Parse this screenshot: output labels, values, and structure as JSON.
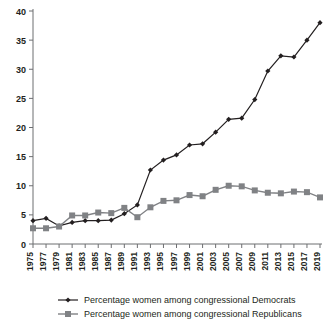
{
  "chart_data": {
    "type": "line",
    "title": "",
    "xlabel": "",
    "ylabel": "",
    "ylim": [
      0,
      40
    ],
    "yticks": [
      0,
      5,
      10,
      15,
      20,
      25,
      30,
      35,
      40
    ],
    "grid": false,
    "legend_position": "bottom",
    "x": [
      1975,
      1977,
      1979,
      1981,
      1983,
      1985,
      1987,
      1989,
      1991,
      1993,
      1995,
      1997,
      1999,
      2001,
      2003,
      2005,
      2007,
      2009,
      2011,
      2013,
      2015,
      2017,
      2019
    ],
    "series": [
      {
        "name": "Percentage women among congressional Democrats",
        "color": "#231f20",
        "marker": "diamond",
        "values": [
          4.0,
          4.4,
          3.1,
          3.7,
          4.0,
          4.0,
          4.1,
          5.2,
          6.7,
          12.7,
          14.4,
          15.3,
          17.0,
          17.2,
          19.2,
          21.4,
          21.6,
          24.8,
          29.7,
          32.3,
          32.1,
          35.0,
          38.0
        ]
      },
      {
        "name": "Percentage women among congressional Republicans",
        "color": "#808285",
        "marker": "square",
        "values": [
          2.7,
          2.7,
          3.0,
          4.9,
          4.9,
          5.4,
          5.3,
          6.2,
          4.6,
          6.3,
          7.4,
          7.5,
          8.4,
          8.2,
          9.3,
          10.0,
          9.9,
          9.2,
          8.8,
          8.7,
          9.0,
          8.9,
          8.0
        ]
      }
    ]
  },
  "legend": {
    "items": [
      {
        "label": "Percentage women among congressional Democrats"
      },
      {
        "label": "Percentage women among congressional Republicans"
      }
    ]
  }
}
